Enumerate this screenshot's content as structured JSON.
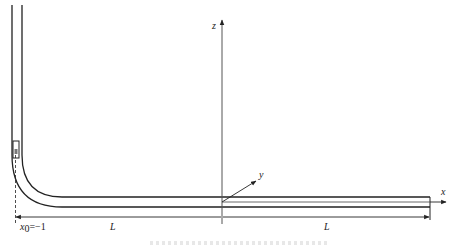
{
  "diagram": {
    "type": "pipe-schematic",
    "axes": {
      "z_label": "z",
      "y_label": "y",
      "x_label": "x"
    },
    "dimensions": {
      "left_segment_label": "L",
      "right_segment_label": "L",
      "origin_label": "x",
      "origin_subscript": "0",
      "origin_value": "=−1"
    },
    "colors": {
      "stroke": "#222222",
      "axis": "#555555",
      "background": "#ffffff"
    }
  }
}
